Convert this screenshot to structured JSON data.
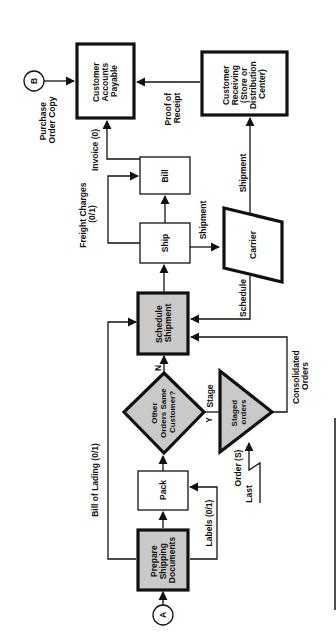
{
  "diagram": {
    "orientation": "rotated-90-ccw",
    "fill_color": "#c9c9c9",
    "connectors": {
      "a": "A",
      "b": "B"
    },
    "nodes": {
      "prepare_shipping_documents": [
        "Prepare",
        "Shipping",
        "Documents"
      ],
      "pack": [
        "Pack"
      ],
      "decision_other_orders": [
        "Other",
        "Orders Same",
        "Customer?"
      ],
      "staged_orders": [
        "Staged",
        "orders"
      ],
      "schedule_shipment": [
        "Schedule",
        "Shipment"
      ],
      "ship": [
        "Ship"
      ],
      "bill": [
        "Bill"
      ],
      "carrier": [
        "Carrier"
      ],
      "customer_accounts_payable": [
        "Customer",
        "Accounts",
        "Payable"
      ],
      "customer_receiving": [
        "Customer",
        "Receiving",
        "(Store or",
        "Distribution",
        "Center)"
      ]
    },
    "edges": {
      "bill_of_lading": "Bill of Lading (0/1)",
      "labels": "Labels (0/1)",
      "stage": "Stage",
      "yes": "Y",
      "no": "N",
      "consolidated_orders": [
        "Consolidated",
        "Orders"
      ],
      "order_s": "Order (S)",
      "last": "Last",
      "schedule": "Schedule",
      "shipment_ship_carrier": "Shipment",
      "shipment_carrier_receiving": "Shipment",
      "freight_charges": [
        "Freight Charges",
        "(0/1)"
      ],
      "invoice": "Invoice (0)",
      "proof_of_receipt": [
        "Proof of",
        "Receipt"
      ],
      "purchase_order_copy": [
        "Purchase",
        "Order Copy"
      ]
    }
  }
}
